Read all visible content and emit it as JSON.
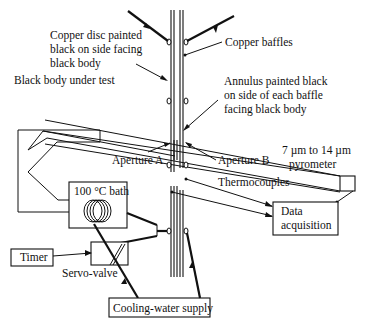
{
  "diagram": {
    "labels": {
      "copper_disc": [
        "Copper disc painted",
        "black on side facing",
        "black body"
      ],
      "copper_baffles": "Copper baffles",
      "annulus": [
        "Annulus painted black",
        "on side of each baffle",
        "facing black body"
      ],
      "black_body": "Black body under test",
      "pyrometer": [
        "7 µm to 14 µm",
        "pyrometer"
      ],
      "aperture_a": "Aperture A",
      "aperture_b": "Aperture B",
      "thermocouples": "Thermocouples",
      "bath": "100 °C bath",
      "data_acquisition": [
        "Data",
        "acquisition"
      ],
      "timer": "Timer",
      "servo_valve": "Servo-valve",
      "cooling_water": "Cooling-water supply"
    },
    "colors": {
      "ink": "#111111",
      "background": "#ffffff"
    }
  }
}
